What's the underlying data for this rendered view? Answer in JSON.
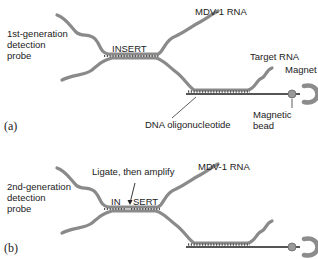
{
  "panel_a": {
    "letter": "(a)",
    "probe_label_lines": [
      "1st-generation",
      "detection",
      "probe"
    ],
    "insert_label": "INSERT",
    "mdv_label": "MDV-1 RNA",
    "target_label": "Target RNA",
    "magnet_label": "Magnet",
    "bead_label_lines": [
      "Magnetic",
      "bead"
    ],
    "oligo_label": "DNA oligonucleotide"
  },
  "panel_b": {
    "letter": "(b)",
    "probe_label_lines": [
      "2nd-generation",
      "detection",
      "probe"
    ],
    "insert_left": "IN",
    "insert_right": "SERT",
    "ligate_label": "Ligate, then amplify",
    "mdv_label": "MDV-1 RNA"
  },
  "colors": {
    "strand": "#8a8a8a",
    "strand_dark": "#6e6e6e",
    "dna": "#555555",
    "bead": "#9a9a9a",
    "magnet": "#8c8c8c",
    "text": "#222222"
  }
}
